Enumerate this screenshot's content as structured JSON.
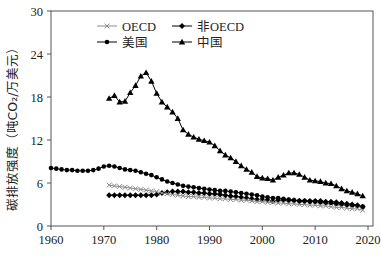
{
  "chart_data": {
    "type": "line",
    "title": "",
    "xlabel": "",
    "ylabel": "碳排放强度（吨CO₂/万美元）",
    "xlim": [
      1960,
      2020
    ],
    "ylim": [
      0,
      30
    ],
    "xticks": [
      1960,
      1970,
      1980,
      1990,
      2000,
      2010,
      2020
    ],
    "yticks": [
      0,
      6,
      12,
      18,
      24,
      30
    ],
    "grid": false,
    "legend_position": "top-left inside, 2 columns",
    "legend": [
      "OECD",
      "非OECD",
      "美国",
      "中国"
    ],
    "series": [
      {
        "name": "OECD",
        "marker": "x",
        "color": "#8a8a8a",
        "x": [
          1971,
          1972,
          1973,
          1974,
          1975,
          1976,
          1977,
          1978,
          1979,
          1980,
          1981,
          1982,
          1983,
          1984,
          1985,
          1986,
          1987,
          1988,
          1989,
          1990,
          1991,
          1992,
          1993,
          1994,
          1995,
          1996,
          1997,
          1998,
          1999,
          2000,
          2001,
          2002,
          2003,
          2004,
          2005,
          2006,
          2007,
          2008,
          2009,
          2010,
          2011,
          2012,
          2013,
          2014,
          2015,
          2016,
          2017,
          2018,
          2019
        ],
        "values": [
          5.7,
          5.6,
          5.5,
          5.4,
          5.3,
          5.2,
          5.1,
          5.0,
          4.9,
          4.8,
          4.6,
          4.5,
          4.4,
          4.3,
          4.2,
          4.1,
          4.1,
          4.0,
          4.0,
          3.9,
          3.9,
          3.8,
          3.8,
          3.7,
          3.7,
          3.6,
          3.6,
          3.5,
          3.4,
          3.4,
          3.3,
          3.3,
          3.2,
          3.2,
          3.1,
          3.1,
          3.0,
          3.0,
          2.9,
          2.9,
          2.8,
          2.8,
          2.7,
          2.6,
          2.6,
          2.5,
          2.4,
          2.4,
          2.2
        ]
      },
      {
        "name": "非OECD",
        "marker": "diamond",
        "color": "#000000",
        "x": [
          1971,
          1972,
          1973,
          1974,
          1975,
          1976,
          1977,
          1978,
          1979,
          1980,
          1981,
          1982,
          1983,
          1984,
          1985,
          1986,
          1987,
          1988,
          1989,
          1990,
          1991,
          1992,
          1993,
          1994,
          1995,
          1996,
          1997,
          1998,
          1999,
          2000,
          2001,
          2002,
          2003,
          2004,
          2005,
          2006,
          2007,
          2008,
          2009,
          2010,
          2011,
          2012,
          2013,
          2014,
          2015,
          2016,
          2017,
          2018,
          2019
        ],
        "values": [
          4.3,
          4.3,
          4.3,
          4.3,
          4.3,
          4.3,
          4.3,
          4.3,
          4.3,
          4.4,
          4.6,
          4.7,
          4.8,
          4.8,
          4.8,
          4.7,
          4.7,
          4.6,
          4.6,
          4.5,
          4.5,
          4.4,
          4.3,
          4.2,
          4.1,
          4.0,
          3.9,
          3.8,
          3.7,
          3.7,
          3.6,
          3.5,
          3.6,
          3.6,
          3.6,
          3.6,
          3.5,
          3.5,
          3.5,
          3.5,
          3.5,
          3.4,
          3.4,
          3.3,
          3.2,
          3.1,
          3.0,
          2.9,
          2.7
        ]
      },
      {
        "name": "美国",
        "marker": "circle",
        "color": "#000000",
        "x": [
          1960,
          1961,
          1962,
          1963,
          1964,
          1965,
          1966,
          1967,
          1968,
          1969,
          1970,
          1971,
          1972,
          1973,
          1974,
          1975,
          1976,
          1977,
          1978,
          1979,
          1980,
          1981,
          1982,
          1983,
          1984,
          1985,
          1986,
          1987,
          1988,
          1989,
          1990,
          1991,
          1992,
          1993,
          1994,
          1995,
          1996,
          1997,
          1998,
          1999,
          2000,
          2001,
          2002,
          2003,
          2004,
          2005,
          2006,
          2007,
          2008,
          2009,
          2010,
          2011,
          2012,
          2013,
          2014,
          2015,
          2016,
          2017,
          2018,
          2019
        ],
        "values": [
          8.1,
          8.0,
          7.9,
          7.8,
          7.8,
          7.7,
          7.7,
          7.7,
          7.8,
          8.0,
          8.3,
          8.4,
          8.3,
          8.1,
          7.9,
          7.8,
          7.7,
          7.5,
          7.3,
          7.1,
          6.8,
          6.5,
          6.2,
          6.0,
          5.8,
          5.6,
          5.5,
          5.4,
          5.3,
          5.2,
          5.1,
          5.0,
          4.9,
          4.9,
          4.8,
          4.7,
          4.6,
          4.5,
          4.4,
          4.3,
          4.1,
          4.0,
          3.9,
          3.9,
          3.8,
          3.7,
          3.6,
          3.5,
          3.5,
          3.4,
          3.4,
          3.3,
          3.2,
          3.2,
          3.1,
          3.0,
          2.9,
          2.9,
          2.8,
          2.7
        ]
      },
      {
        "name": "中国",
        "marker": "triangle",
        "color": "#000000",
        "x": [
          1971,
          1972,
          1973,
          1974,
          1975,
          1976,
          1977,
          1978,
          1979,
          1980,
          1981,
          1982,
          1983,
          1984,
          1985,
          1986,
          1987,
          1988,
          1989,
          1990,
          1991,
          1992,
          1993,
          1994,
          1995,
          1996,
          1997,
          1998,
          1999,
          2000,
          2001,
          2002,
          2003,
          2004,
          2005,
          2006,
          2007,
          2008,
          2009,
          2010,
          2011,
          2012,
          2013,
          2014,
          2015,
          2016,
          2017,
          2018,
          2019
        ],
        "values": [
          17.8,
          18.2,
          17.3,
          17.4,
          18.6,
          19.6,
          20.9,
          21.4,
          20.2,
          18.5,
          17.3,
          16.6,
          15.9,
          15.0,
          13.4,
          12.8,
          12.4,
          12.1,
          11.9,
          11.7,
          11.2,
          10.5,
          9.9,
          9.5,
          9.0,
          8.4,
          7.9,
          7.5,
          6.9,
          6.7,
          6.6,
          6.4,
          6.8,
          7.1,
          7.4,
          7.4,
          7.2,
          6.8,
          6.4,
          6.3,
          6.2,
          6.0,
          5.9,
          5.6,
          5.2,
          4.9,
          4.7,
          4.5,
          4.2
        ]
      }
    ]
  },
  "axes": {
    "ylabel": "碳排放强度（吨CO₂/万美元）",
    "xtick_labels": [
      "1960",
      "1970",
      "1980",
      "1990",
      "2000",
      "2010",
      "2020"
    ],
    "ytick_labels": [
      "0",
      "6",
      "12",
      "18",
      "24",
      "30"
    ]
  },
  "legend": {
    "items": [
      {
        "label": "OECD",
        "marker": "x"
      },
      {
        "label": "非OECD",
        "marker": "diamond"
      },
      {
        "label": "美国",
        "marker": "circle"
      },
      {
        "label": "中国",
        "marker": "triangle"
      }
    ]
  }
}
